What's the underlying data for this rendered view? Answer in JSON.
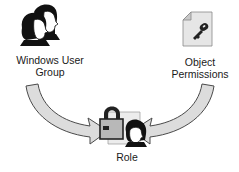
{
  "diagram": {
    "nodes": [
      {
        "id": "group",
        "icon": "user-group-icon",
        "label_line1": "Windows User",
        "label_line2": "Group"
      },
      {
        "id": "permissions",
        "icon": "key-document-icon",
        "label_line1": "Object",
        "label_line2": "Permissions"
      },
      {
        "id": "role",
        "icon": "lock-user-role-icon",
        "label": "Role"
      }
    ],
    "edges": [
      {
        "from": "group",
        "to": "role",
        "style": "curved-block-arrow"
      },
      {
        "from": "permissions",
        "to": "role",
        "style": "curved-block-arrow"
      }
    ],
    "colors": {
      "arrow_fill": "#dcdcdc",
      "arrow_stroke": "#4a4a4a",
      "icon_dark": "#111111",
      "doc_fill": "#e6e6e6"
    }
  }
}
